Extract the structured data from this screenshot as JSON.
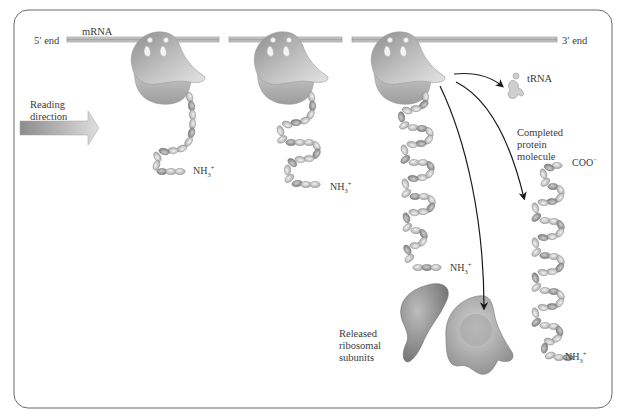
{
  "diagram": {
    "colors": {
      "frame": "#6a6a6a",
      "mrna": "#b8b8b8",
      "ribosome": "#9a9a9a",
      "ribosome_light": "#d6d6d6",
      "chain": "#c4c4c4",
      "chain_dark": "#8c8c8c",
      "arrow": "#1a1a1a",
      "reading_arrow": "#a8a8a8",
      "text": "#3a3a3a"
    },
    "labels": {
      "five_prime": "5′ end",
      "mrna": "mRNA",
      "three_prime": "3′ end",
      "reading_direction": "Reading\ndirection",
      "trna": "tRNA",
      "completed_protein": "Completed\nprotein\nmolecule",
      "released_subunits": "Released\nribosomal\nsubunits"
    },
    "chemistry": {
      "n_terminus_main": "NH",
      "n_terminus_sub": "3",
      "n_terminus_sup": "+",
      "c_terminus_main": "COO",
      "c_terminus_sup": "−"
    },
    "stages": [
      {
        "name": "ribosome-stage-1",
        "n_terminus": "NH3+"
      },
      {
        "name": "ribosome-stage-2",
        "n_terminus": "NH3+"
      },
      {
        "name": "ribosome-stage-3",
        "n_terminus": "NH3+"
      },
      {
        "name": "completed-protein",
        "n_terminus": "NH3+",
        "c_terminus": "COO−"
      }
    ]
  }
}
